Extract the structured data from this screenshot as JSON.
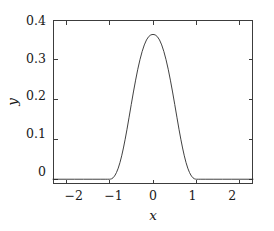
{
  "chart_data": {
    "type": "line",
    "title": "",
    "subtitle": "",
    "xlabel": "x",
    "ylabel": "y",
    "xlim": [
      -2.3,
      2.3
    ],
    "ylim": [
      -0.012,
      0.4
    ],
    "grid": false,
    "legend": null,
    "legend_position": "none",
    "xticks": [
      -2,
      -1,
      0,
      1,
      2
    ],
    "xtick_labels": [
      "−2",
      "−1",
      "0",
      "1",
      "2"
    ],
    "yticks": [
      0,
      0.1,
      0.2,
      0.3,
      0.4
    ],
    "ytick_labels": [
      "0",
      "0.1",
      "0.2",
      "0.3",
      "0.4"
    ],
    "series": [
      {
        "name": "bump",
        "color": "#2b2b2b",
        "line_width": 0.9,
        "x": [
          -2.3,
          -2.0,
          -1.8,
          -1.6,
          -1.4,
          -1.2,
          -1.1,
          -1.05,
          -1.0,
          -0.98,
          -0.95,
          -0.92,
          -0.9,
          -0.87,
          -0.84,
          -0.8,
          -0.76,
          -0.72,
          -0.68,
          -0.64,
          -0.6,
          -0.55,
          -0.5,
          -0.45,
          -0.4,
          -0.35,
          -0.3,
          -0.25,
          -0.2,
          -0.15,
          -0.1,
          -0.05,
          0.0,
          0.05,
          0.1,
          0.15,
          0.2,
          0.25,
          0.3,
          0.35,
          0.4,
          0.45,
          0.5,
          0.55,
          0.6,
          0.64,
          0.68,
          0.72,
          0.76,
          0.8,
          0.84,
          0.87,
          0.9,
          0.92,
          0.95,
          0.98,
          1.0,
          1.05,
          1.1,
          1.2,
          1.4,
          1.6,
          1.8,
          2.0,
          2.3
        ],
        "y": [
          0.0,
          0.0,
          0.0,
          0.0,
          0.0,
          0.0,
          0.0,
          0.0,
          0.0,
          0.0002,
          0.0012,
          0.0035,
          0.0058,
          0.0105,
          0.0168,
          0.0278,
          0.0418,
          0.0588,
          0.0785,
          0.1005,
          0.1242,
          0.1558,
          0.1878,
          0.2192,
          0.2489,
          0.2762,
          0.3003,
          0.3208,
          0.3374,
          0.3499,
          0.3582,
          0.3626,
          0.3638,
          0.3626,
          0.3582,
          0.3499,
          0.3374,
          0.3208,
          0.3003,
          0.2762,
          0.2489,
          0.2192,
          0.1878,
          0.1558,
          0.1242,
          0.1005,
          0.0785,
          0.0588,
          0.0418,
          0.0278,
          0.0168,
          0.0105,
          0.0058,
          0.0035,
          0.0012,
          0.0002,
          0.0,
          0.0,
          0.0,
          0.0,
          0.0,
          0.0,
          0.0,
          0.0,
          0.0
        ],
        "peak_x": 0,
        "peak_y": 0.364,
        "support": [
          -1,
          1
        ]
      }
    ],
    "annotations": []
  },
  "axes": {
    "frame_color": "#3c3c3c",
    "background": "#ffffff",
    "tick_direction": "in",
    "mirror_ticks": true
  }
}
